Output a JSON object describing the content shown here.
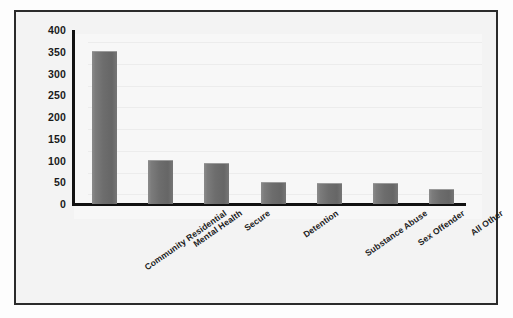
{
  "chart_data": {
    "type": "bar",
    "title": "",
    "subtitle": "",
    "xlabel": "",
    "ylabel": "",
    "categories": [
      "Community Residential",
      "Mental Health",
      "Secure",
      "Detention",
      "Substance Abuse",
      "Sex Offender",
      "All Other"
    ],
    "values": [
      350,
      98,
      91,
      48,
      45,
      45,
      32
    ],
    "ylim": [
      0,
      400
    ],
    "ytick_labels": [
      "400",
      "350",
      "300",
      "250",
      "200",
      "150",
      "100",
      "50",
      "0"
    ],
    "ytick_values": [
      400,
      350,
      300,
      250,
      200,
      150,
      100,
      50,
      0
    ],
    "ytick_step": 50,
    "grid": true,
    "legend": false,
    "legend_position": "none",
    "orientation": "vertical",
    "xtick_rotation": -35,
    "colors": {
      "bar_fill": "#6d6d6d",
      "bar_highlight": "#8b8b8b",
      "axis_line": "#111111",
      "frame_border": "#2b2b2b",
      "plot_background": "#f7f7f7",
      "figure_background": "#fdfdfd",
      "gridline": "#ececec",
      "tick_text": "#1a1a1a"
    }
  }
}
